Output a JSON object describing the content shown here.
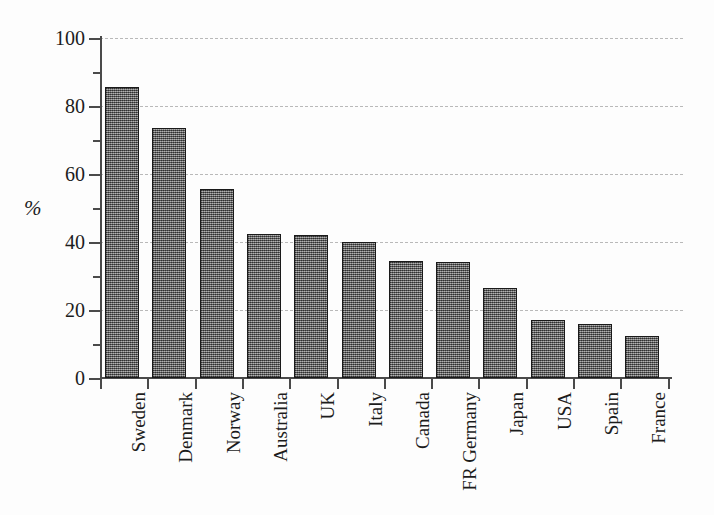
{
  "chart_data": {
    "type": "bar",
    "title": "",
    "xlabel": "",
    "ylabel": "%",
    "ylim": [
      0,
      100
    ],
    "y_major_ticks": [
      0,
      20,
      40,
      60,
      80,
      100
    ],
    "y_minor_ticks": [
      10,
      30,
      50,
      70,
      90
    ],
    "y_tick_labels": [
      "0",
      "20",
      "40",
      "60",
      "80",
      "100"
    ],
    "grid": "horizontal-dashed-at-major-ticks",
    "legend": "none",
    "bar_fill": "#6e6e6e",
    "bar_edge": "#1a1a1a",
    "grid_color": "#b9b9b9",
    "axis_color": "#4a4a4a",
    "categories": [
      "Sweden",
      "Denmark",
      "Norway",
      "Australia",
      "UK",
      "Italy",
      "Canada",
      "FR Germany",
      "Japan",
      "USA",
      "Spain",
      "France"
    ],
    "values": [
      85.5,
      73.5,
      55.5,
      42.5,
      42,
      40,
      34.5,
      34,
      26.5,
      17,
      16,
      12.5
    ]
  }
}
